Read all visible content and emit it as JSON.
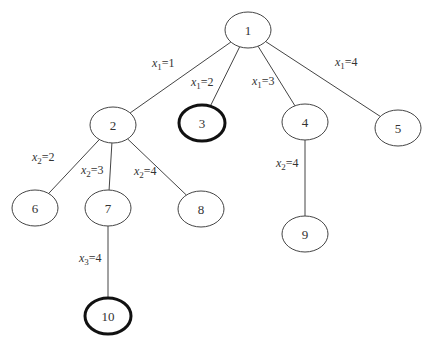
{
  "diagram": {
    "type": "search-tree",
    "nodes": [
      {
        "id": "1",
        "label": "1",
        "cx": 248,
        "cy": 30,
        "bold": false
      },
      {
        "id": "2",
        "label": "2",
        "cx": 113,
        "cy": 125,
        "bold": false
      },
      {
        "id": "3",
        "label": "3",
        "cx": 202,
        "cy": 123,
        "bold": true
      },
      {
        "id": "4",
        "label": "4",
        "cx": 305,
        "cy": 122,
        "bold": false
      },
      {
        "id": "5",
        "label": "5",
        "cx": 398,
        "cy": 128,
        "bold": false
      },
      {
        "id": "6",
        "label": "6",
        "cx": 35,
        "cy": 208,
        "bold": false
      },
      {
        "id": "7",
        "label": "7",
        "cx": 108,
        "cy": 208,
        "bold": false
      },
      {
        "id": "8",
        "label": "8",
        "cx": 201,
        "cy": 209,
        "bold": false
      },
      {
        "id": "9",
        "label": "9",
        "cx": 305,
        "cy": 234,
        "bold": false
      },
      {
        "id": "10",
        "label": "10",
        "cx": 108,
        "cy": 316,
        "bold": true
      }
    ],
    "edges": [
      {
        "from": "1",
        "to": "2",
        "var": "x",
        "sub": "1",
        "value": "=1",
        "lx": 152,
        "ly": 67
      },
      {
        "from": "1",
        "to": "3",
        "var": "x",
        "sub": "1",
        "value": "=2",
        "lx": 191,
        "ly": 86
      },
      {
        "from": "1",
        "to": "4",
        "var": "x",
        "sub": "1",
        "value": "=3",
        "lx": 252,
        "ly": 85
      },
      {
        "from": "1",
        "to": "5",
        "var": "x",
        "sub": "1",
        "value": "=4",
        "lx": 335,
        "ly": 66
      },
      {
        "from": "2",
        "to": "6",
        "var": "x",
        "sub": "2",
        "value": "=2",
        "lx": 32,
        "ly": 161
      },
      {
        "from": "2",
        "to": "7",
        "var": "x",
        "sub": "2",
        "value": "=3",
        "lx": 81,
        "ly": 174
      },
      {
        "from": "2",
        "to": "8",
        "var": "x",
        "sub": "2",
        "value": "=4",
        "lx": 134,
        "ly": 175
      },
      {
        "from": "4",
        "to": "9",
        "var": "x",
        "sub": "2",
        "value": "=4",
        "lx": 276,
        "ly": 167
      },
      {
        "from": "7",
        "to": "10",
        "var": "x",
        "sub": "3",
        "value": "=4",
        "lx": 79,
        "ly": 262
      }
    ]
  }
}
